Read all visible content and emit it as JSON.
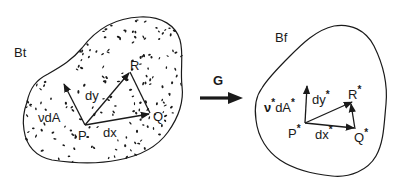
{
  "diagram": {
    "type": "continuum-deformation",
    "mapping_label": "G",
    "left_body": {
      "label": "Bt",
      "stippled": true,
      "points": {
        "P": "P",
        "Q": "Q",
        "R": "R"
      },
      "vectors": {
        "dx": "dx",
        "dy": "dy"
      },
      "area_element": "νdA"
    },
    "right_body": {
      "label": "Bf",
      "stippled": false,
      "points": {
        "P": "P",
        "Q": "Q",
        "R": "R",
        "star": "*"
      },
      "vectors": {
        "dx": "dx",
        "dy": "dy",
        "star": "*"
      },
      "area_element_nu": "ν",
      "area_element_dA": "dA",
      "star": "*"
    },
    "colors": {
      "ink": "#1a1a1a",
      "background": "#ffffff"
    }
  }
}
